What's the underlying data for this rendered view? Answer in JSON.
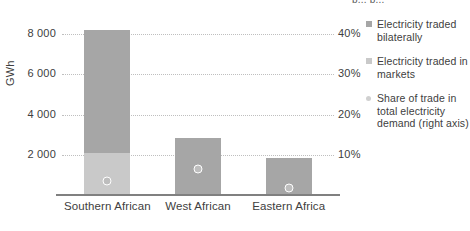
{
  "title_fragment": "p...  p...",
  "chart_data": {
    "type": "bar",
    "title": "",
    "xlabel": "",
    "ylabel": "GWh",
    "categories": [
      "Southern African",
      "West African",
      "Eastern Africa"
    ],
    "ylim": [
      0,
      9000
    ],
    "yticks": [
      2000,
      4000,
      6000,
      8000
    ],
    "ytick_labels": [
      "2 000",
      "4 000",
      "6 000",
      "8 000"
    ],
    "y2label": "",
    "y2lim": [
      0,
      45
    ],
    "y2ticks": [
      10,
      20,
      30,
      40
    ],
    "y2tick_labels": [
      "10%",
      "20%",
      "30%",
      "40%"
    ],
    "grid": true,
    "stacked": true,
    "legend_position": "right",
    "series": [
      {
        "name": "Electricity traded bilaterally",
        "axis": "left",
        "type": "bar",
        "color": "#a6a6a6",
        "values": [
          6100,
          2850,
          1850
        ]
      },
      {
        "name": "Electricity traded in markets",
        "axis": "left",
        "type": "bar",
        "color": "#c9c9c9",
        "values": [
          2100,
          0,
          0
        ]
      },
      {
        "name": "Share of trade in total electricity demand (right axis)",
        "axis": "right",
        "type": "scatter",
        "color": "#bdbdbd",
        "values": [
          3.5,
          6.5,
          1.7
        ]
      }
    ]
  },
  "legend": {
    "items": [
      {
        "label": "Electricity traded bilaterally",
        "swatch": "square-swatch-bilateral"
      },
      {
        "label": "Electricity traded in markets",
        "swatch": "square-swatch-markets"
      },
      {
        "label": "Share of trade in total electricity demand (right axis)",
        "swatch": "circle-swatch-share"
      }
    ]
  },
  "axes": {
    "left_title": "GWh"
  }
}
